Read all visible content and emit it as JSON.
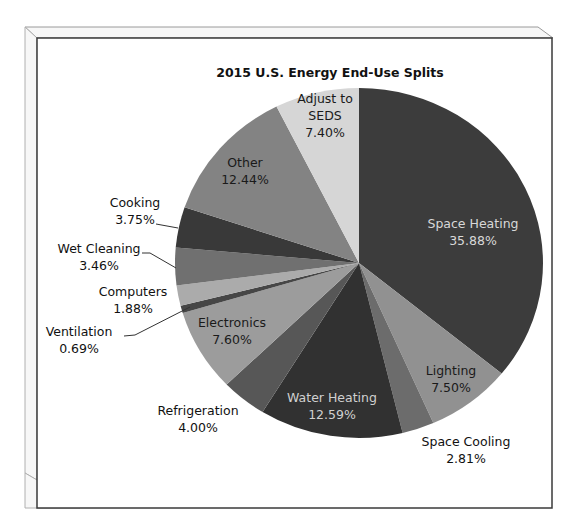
{
  "chart_data": {
    "type": "pie",
    "title": "2015 U.S. Energy End-Use Splits",
    "start_angle_deg": 0,
    "direction": "clockwise",
    "legend": "none (data labels on slices)",
    "slices": [
      {
        "label": "Space Heating",
        "value": 35.88,
        "display": "35.88%",
        "color": "#3c3c3c",
        "label_color": "#d8d8d8",
        "label_pos": [
          473,
          228
        ],
        "inside": true
      },
      {
        "label": "Lighting",
        "value": 7.5,
        "display": "7.50%",
        "color": "#919191",
        "label_color": "#1a1a1a",
        "label_pos": [
          451,
          375
        ],
        "inside": true
      },
      {
        "label": "Space Cooling",
        "value": 2.81,
        "display": "2.81%",
        "color": "#6c6c6c",
        "label_color": "#111111",
        "label_pos": [
          466,
          446
        ],
        "inside": false
      },
      {
        "label": "Water Heating",
        "value": 12.59,
        "display": "12.59%",
        "color": "#313131",
        "label_color": "#d0d0d0",
        "label_pos": [
          332,
          402
        ],
        "inside": true
      },
      {
        "label": "Refrigeration",
        "value": 4.0,
        "display": "4.00%",
        "color": "#575757",
        "label_color": "#111111",
        "label_pos": [
          198,
          415
        ],
        "inside": false
      },
      {
        "label": "Electronics",
        "value": 7.6,
        "display": "7.60%",
        "color": "#9c9c9c",
        "label_color": "#1a1a1a",
        "label_pos": [
          232,
          327
        ],
        "inside": true
      },
      {
        "label": "Ventilation",
        "value": 0.69,
        "display": "0.69%",
        "color": "#464646",
        "label_color": "#111111",
        "label_pos": [
          79,
          336
        ],
        "inside": false,
        "leader": [
          [
            124,
            336
          ],
          [
            135,
            335
          ],
          [
            190,
            307
          ]
        ]
      },
      {
        "label": "Computers",
        "value": 1.88,
        "display": "1.88%",
        "color": "#ababab",
        "label_color": "#111111",
        "label_pos": [
          133,
          296
        ],
        "inside": false
      },
      {
        "label": "Wet Cleaning",
        "value": 3.46,
        "display": "3.46%",
        "color": "#707070",
        "label_color": "#111111",
        "label_pos": [
          99,
          253
        ],
        "inside": false,
        "leader": [
          [
            142,
            253
          ],
          [
            150,
            253
          ],
          [
            176,
            268
          ]
        ]
      },
      {
        "label": "Cooking",
        "value": 3.75,
        "display": "3.75%",
        "color": "#393939",
        "label_color": "#111111",
        "label_pos": [
          135,
          207
        ],
        "inside": false,
        "leader": [
          [
            156,
            224
          ],
          [
            178,
            228
          ]
        ]
      },
      {
        "label": "Other",
        "value": 12.44,
        "display": "12.44%",
        "color": "#838383",
        "label_color": "#1a1a1a",
        "label_pos": [
          245,
          167
        ],
        "inside": true
      },
      {
        "label": "Adjust to SEDS",
        "value": 7.4,
        "display": "7.40%",
        "color": "#d6d6d6",
        "label_color": "#1a1a1a",
        "label_pos": [
          325,
          120
        ],
        "inside": true,
        "multiline": [
          "Adjust to",
          "SEDS"
        ]
      }
    ]
  }
}
